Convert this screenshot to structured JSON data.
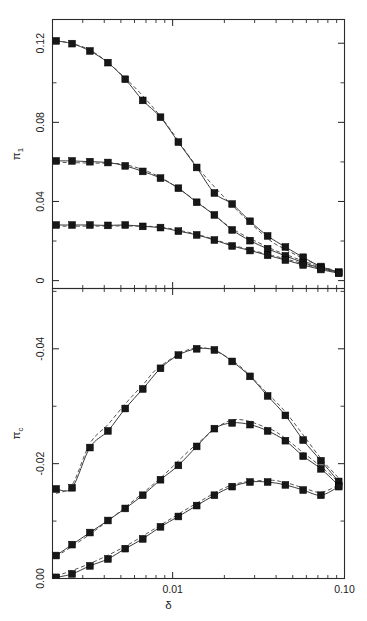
{
  "figure": {
    "background": "#ffffff",
    "line_color": "#3a3a3a",
    "marker_color": "#171717",
    "axis_color": "#2b2b2b"
  },
  "chart_data": [
    {
      "type": "line",
      "panel": "top",
      "title": "",
      "xlabel": "",
      "ylabel": "π₁",
      "ylabel_base": "π",
      "ylabel_sub": "1",
      "xscale": "log",
      "xlim": [
        0.002,
        0.1
      ],
      "ylim": [
        -0.004,
        0.132
      ],
      "yticks": [
        0,
        0.04,
        0.08,
        0.12
      ],
      "yticklabels": [
        "0",
        "0.04",
        "0.08",
        "0.12"
      ],
      "yminor": [
        0.02,
        0.06,
        0.1
      ],
      "xticks": [
        0.01,
        0.1
      ],
      "xticklabels": [
        "0.01",
        "0.10"
      ],
      "grid": false,
      "legend": "none",
      "series": [
        {
          "name": "upper-branch",
          "style": "solid-with-markers",
          "x": [
            0.0021,
            0.0026,
            0.0033,
            0.0042,
            0.0053,
            0.0067,
            0.0085,
            0.0108,
            0.0138,
            0.0175,
            0.0222,
            0.0282,
            0.0357,
            0.0453,
            0.0575,
            0.0729,
            0.0925
          ],
          "y": [
            0.1212,
            0.1198,
            0.1161,
            0.1102,
            0.1018,
            0.0911,
            0.0826,
            0.07,
            0.0572,
            0.0443,
            0.0387,
            0.03,
            0.0226,
            0.017,
            0.0118,
            0.0071,
            0.0043
          ]
        },
        {
          "name": "middle-branch",
          "style": "solid-with-markers",
          "x": [
            0.0021,
            0.0026,
            0.0033,
            0.0042,
            0.0053,
            0.0067,
            0.0085,
            0.0108,
            0.0138,
            0.0175,
            0.0222,
            0.0282,
            0.0357,
            0.0453,
            0.0575,
            0.0729,
            0.0925
          ],
          "y": [
            0.0605,
            0.0605,
            0.0601,
            0.0597,
            0.058,
            0.0552,
            0.0518,
            0.0467,
            0.0396,
            0.0332,
            0.0256,
            0.0202,
            0.0161,
            0.0125,
            0.0091,
            0.0063,
            0.004
          ]
        },
        {
          "name": "lower-branch",
          "style": "solid-with-markers",
          "x": [
            0.0021,
            0.0026,
            0.0033,
            0.0042,
            0.0053,
            0.0067,
            0.0085,
            0.0108,
            0.0138,
            0.0175,
            0.0222,
            0.0282,
            0.0357,
            0.0453,
            0.0575,
            0.0729,
            0.0925
          ],
          "y": [
            0.0281,
            0.0281,
            0.0281,
            0.0279,
            0.0281,
            0.0274,
            0.0268,
            0.025,
            0.0231,
            0.0205,
            0.0175,
            0.0152,
            0.0128,
            0.0104,
            0.0079,
            0.0056,
            0.0037
          ]
        }
      ],
      "dashed_fits": [
        {
          "name": "upper-branch-fit",
          "x": [
            0.0021,
            0.0033,
            0.0053,
            0.0085,
            0.0138,
            0.0222,
            0.0357,
            0.0453,
            0.0575,
            0.0729,
            0.0925
          ],
          "y": [
            0.1215,
            0.1166,
            0.1024,
            0.083,
            0.0578,
            0.038,
            0.0213,
            0.0158,
            0.0112,
            0.0073,
            0.0046
          ]
        },
        {
          "name": "middle-branch-fit",
          "x": [
            0.0021,
            0.0033,
            0.0053,
            0.0085,
            0.0138,
            0.0222,
            0.0357,
            0.0453,
            0.0575,
            0.0729,
            0.0925
          ],
          "y": [
            0.0598,
            0.0594,
            0.0586,
            0.0522,
            0.04,
            0.0263,
            0.017,
            0.0133,
            0.0099,
            0.0068,
            0.0043
          ]
        },
        {
          "name": "lower-branch-fit",
          "x": [
            0.0021,
            0.0033,
            0.0053,
            0.0085,
            0.0138,
            0.0222,
            0.0357,
            0.0453,
            0.0575,
            0.0729,
            0.0925
          ],
          "y": [
            0.0275,
            0.0275,
            0.0276,
            0.027,
            0.0234,
            0.018,
            0.0133,
            0.011,
            0.0085,
            0.006,
            0.004
          ]
        }
      ]
    },
    {
      "type": "line",
      "panel": "bottom",
      "title": "",
      "xlabel": "δ",
      "ylabel": "π_c",
      "ylabel_base": "π",
      "ylabel_sub": "c",
      "xscale": "log",
      "xlim": [
        0.002,
        0.1
      ],
      "ylim": [
        0.0,
        -0.0505
      ],
      "yticks": [
        0.0,
        -0.02,
        -0.04
      ],
      "yticklabels": [
        "0.00",
        "-0.02",
        "-0.04"
      ],
      "yminor": [
        -0.01,
        -0.03,
        -0.05
      ],
      "xticks": [
        0.01,
        0.1
      ],
      "xticklabels": [
        "0.01",
        "0.10"
      ],
      "grid": false,
      "legend": "none",
      "series": [
        {
          "name": "upper-branch",
          "style": "solid-with-markers",
          "x": [
            0.0021,
            0.0026,
            0.0033,
            0.0042,
            0.0053,
            0.0067,
            0.0085,
            0.0108,
            0.0138,
            0.0175,
            0.0222,
            0.0282,
            0.0357,
            0.0453,
            0.0575,
            0.0729,
            0.0925
          ],
          "y": [
            -0.0156,
            -0.0158,
            -0.0228,
            -0.0257,
            -0.0296,
            -0.033,
            -0.0366,
            -0.0389,
            -0.04,
            -0.0398,
            -0.0378,
            -0.0352,
            -0.0318,
            -0.0284,
            -0.0241,
            -0.0205,
            -0.0169
          ]
        },
        {
          "name": "middle-branch",
          "style": "solid-with-markers",
          "x": [
            0.0021,
            0.0026,
            0.0033,
            0.0042,
            0.0053,
            0.0067,
            0.0085,
            0.0108,
            0.0138,
            0.0175,
            0.0222,
            0.0282,
            0.0357,
            0.0453,
            0.0575,
            0.0729,
            0.0925
          ],
          "y": [
            -0.004,
            -0.0059,
            -0.008,
            -0.0101,
            -0.0122,
            -0.0145,
            -0.0172,
            -0.0197,
            -0.023,
            -0.0261,
            -0.0271,
            -0.0268,
            -0.0257,
            -0.024,
            -0.0213,
            -0.0191,
            -0.0162
          ]
        },
        {
          "name": "lower-branch",
          "style": "solid-with-markers",
          "x": [
            0.0021,
            0.0026,
            0.0033,
            0.0042,
            0.0053,
            0.0067,
            0.0085,
            0.0108,
            0.0138,
            0.0175,
            0.0222,
            0.0282,
            0.0357,
            0.0453,
            0.0575,
            0.0729,
            0.0925
          ],
          "y": [
            -0.0002,
            -0.0008,
            -0.0022,
            -0.0034,
            -0.0052,
            -0.0069,
            -0.009,
            -0.0108,
            -0.0127,
            -0.0145,
            -0.016,
            -0.0168,
            -0.0168,
            -0.0163,
            -0.0154,
            -0.0145,
            -0.016
          ]
        }
      ],
      "dashed_fits": [
        {
          "name": "upper-branch-fit",
          "x": [
            0.0021,
            0.0026,
            0.0033,
            0.0042,
            0.0053,
            0.0067,
            0.0085,
            0.0138,
            0.0222,
            0.0357,
            0.0453,
            0.0575,
            0.0729,
            0.0925
          ],
          "y": [
            -0.0148,
            -0.0163,
            -0.0235,
            -0.0268,
            -0.0304,
            -0.0337,
            -0.037,
            -0.0402,
            -0.038,
            -0.0322,
            -0.029,
            -0.025,
            -0.0209,
            -0.0175
          ]
        },
        {
          "name": "middle-branch-fit",
          "x": [
            0.0021,
            0.0033,
            0.0053,
            0.0085,
            0.0138,
            0.0222,
            0.0357,
            0.0453,
            0.0575,
            0.0729,
            0.0925
          ],
          "y": [
            -0.0038,
            -0.0077,
            -0.0124,
            -0.0175,
            -0.0234,
            -0.0276,
            -0.0262,
            -0.0244,
            -0.0219,
            -0.0195,
            -0.0168
          ]
        },
        {
          "name": "lower-branch-fit",
          "x": [
            0.0021,
            0.0033,
            0.0053,
            0.0085,
            0.0138,
            0.0222,
            0.0357,
            0.0453,
            0.0575,
            0.0729,
            0.0925
          ],
          "y": [
            -0.0004,
            -0.0026,
            -0.0056,
            -0.0093,
            -0.0131,
            -0.0163,
            -0.0171,
            -0.0167,
            -0.0158,
            -0.015,
            -0.0163
          ]
        }
      ]
    }
  ]
}
